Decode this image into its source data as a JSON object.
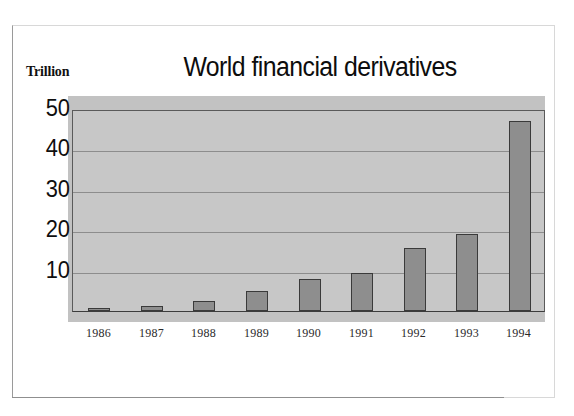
{
  "chart_data": {
    "type": "bar",
    "title": "World financial derivatives",
    "xlabel": "",
    "ylabel": "Trillion",
    "categories": [
      "1986",
      "1987",
      "1988",
      "1989",
      "1990",
      "1991",
      "1992",
      "1993",
      "1994"
    ],
    "values": [
      0.6,
      1.3,
      2.5,
      5,
      8,
      9.5,
      15.5,
      19,
      47
    ],
    "yticks": [
      10,
      20,
      30,
      40,
      50
    ],
    "ylim": [
      0,
      50
    ],
    "grid": true,
    "legend": "none",
    "series": [
      {
        "name": "World financial derivatives",
        "values": [
          0.6,
          1.3,
          2.5,
          5,
          8,
          9.5,
          15.5,
          19,
          47
        ]
      }
    ],
    "colors": {
      "bar_fill": "#8e8e8e",
      "bar_border": "#3a3a3a",
      "plot_background": "#c7c7c7",
      "band_background": "#c2c2c2",
      "gridline": "#8d8d8d",
      "text": "#0f0f0f"
    }
  }
}
